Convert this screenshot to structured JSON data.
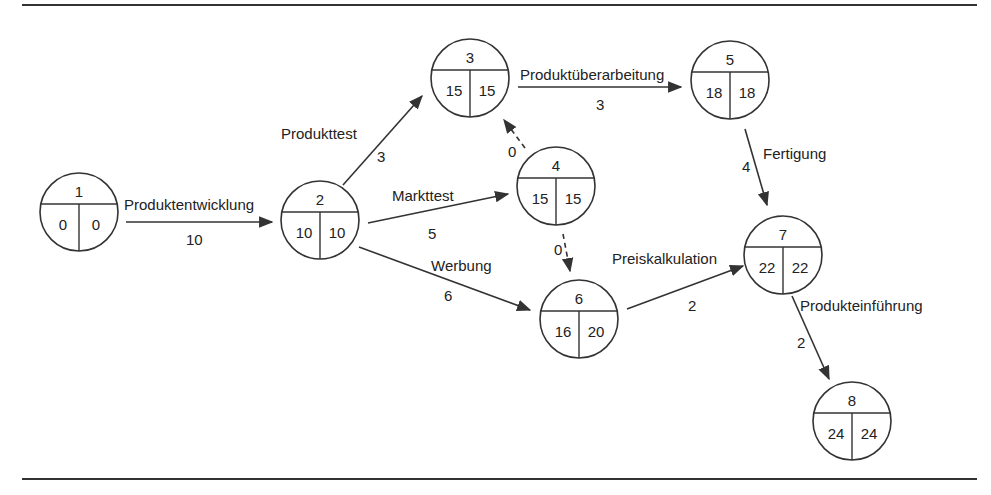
{
  "colors": {
    "stroke": "#333333",
    "text": "#222222",
    "background": "#ffffff"
  },
  "nodes": [
    {
      "id": "1",
      "es": "0",
      "ls": "0",
      "cx": 79,
      "cy": 212
    },
    {
      "id": "2",
      "es": "10",
      "ls": "10",
      "cx": 320,
      "cy": 220
    },
    {
      "id": "3",
      "es": "15",
      "ls": "15",
      "cx": 470,
      "cy": 78
    },
    {
      "id": "4",
      "es": "15",
      "ls": "15",
      "cx": 556,
      "cy": 186
    },
    {
      "id": "5",
      "es": "18",
      "ls": "18",
      "cx": 730,
      "cy": 80
    },
    {
      "id": "6",
      "es": "16",
      "ls": "20",
      "cx": 579,
      "cy": 319
    },
    {
      "id": "7",
      "es": "22",
      "ls": "22",
      "cx": 783,
      "cy": 255
    },
    {
      "id": "8",
      "es": "24",
      "ls": "24",
      "cx": 852,
      "cy": 421
    }
  ],
  "edges": [
    {
      "from": "1",
      "to": "2",
      "label": "Produktentwicklung",
      "duration": "10",
      "dashed": false,
      "x1": 126,
      "y1": 222,
      "x2": 272,
      "y2": 222,
      "lx": 124,
      "ly": 210,
      "dx": 186,
      "dy": 245
    },
    {
      "from": "2",
      "to": "3",
      "label": "Produkttest",
      "duration": "3",
      "dashed": false,
      "x1": 343,
      "y1": 185,
      "x2": 422,
      "y2": 96,
      "lx": 281,
      "ly": 139,
      "dx": 377,
      "dy": 162
    },
    {
      "from": "2",
      "to": "4",
      "label": "Markttest",
      "duration": "5",
      "dashed": false,
      "x1": 368,
      "y1": 223,
      "x2": 508,
      "y2": 194,
      "lx": 392,
      "ly": 201,
      "dx": 428,
      "dy": 239
    },
    {
      "from": "2",
      "to": "6",
      "label": "Werbung",
      "duration": "6",
      "dashed": false,
      "x1": 359,
      "y1": 247,
      "x2": 530,
      "y2": 310,
      "lx": 431,
      "ly": 271,
      "dx": 444,
      "dy": 301
    },
    {
      "from": "4",
      "to": "3",
      "label": "",
      "duration": "0",
      "dashed": true,
      "x1": 525,
      "y1": 148,
      "x2": 504,
      "y2": 120,
      "lx": 0,
      "ly": 0,
      "dx": 508,
      "dy": 157
    },
    {
      "from": "4",
      "to": "6",
      "label": "",
      "duration": "0",
      "dashed": true,
      "x1": 563,
      "y1": 234,
      "x2": 570,
      "y2": 271,
      "lx": 0,
      "ly": 0,
      "dx": 554,
      "dy": 255
    },
    {
      "from": "3",
      "to": "5",
      "label": "Produktüberarbeitung",
      "duration": "3",
      "dashed": false,
      "x1": 518,
      "y1": 87,
      "x2": 681,
      "y2": 87,
      "lx": 520,
      "ly": 80,
      "dx": 596,
      "dy": 110
    },
    {
      "from": "5",
      "to": "7",
      "label": "Fertigung",
      "duration": "4",
      "dashed": false,
      "x1": 745,
      "y1": 129,
      "x2": 767,
      "y2": 205,
      "lx": 763,
      "ly": 159,
      "dx": 742,
      "dy": 172
    },
    {
      "from": "6",
      "to": "7",
      "label": "Preiskalkulation",
      "duration": "2",
      "dashed": false,
      "x1": 627,
      "y1": 309,
      "x2": 743,
      "y2": 266,
      "lx": 612,
      "ly": 264,
      "dx": 688,
      "dy": 311
    },
    {
      "from": "7",
      "to": "8",
      "label": "Produkteinführung",
      "duration": "2",
      "dashed": false,
      "x1": 792,
      "y1": 296,
      "x2": 829,
      "y2": 379,
      "lx": 800,
      "ly": 311,
      "dx": 797,
      "dy": 348
    }
  ],
  "frame": {
    "top_rule_y": 5,
    "bottom_rule_y": 479,
    "x_start": 22,
    "x_end": 977
  },
  "node_radius": 39
}
